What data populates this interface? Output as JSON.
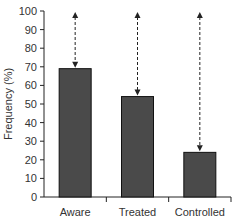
{
  "chart_data": {
    "type": "bar",
    "title": "",
    "xlabel": "",
    "ylabel": "Frequency (%)",
    "categories": [
      "Aware",
      "Treated",
      "Controlled"
    ],
    "values": [
      69,
      54,
      24
    ],
    "ylim": [
      0,
      100
    ],
    "yticks": [
      0,
      10,
      20,
      30,
      40,
      50,
      60,
      70,
      80,
      90,
      100
    ],
    "grid": false,
    "legend": null,
    "annotations": "Dashed double-headed arrows from each bar top to 100% indicating gap",
    "bar_color": "#4a4a4a"
  }
}
